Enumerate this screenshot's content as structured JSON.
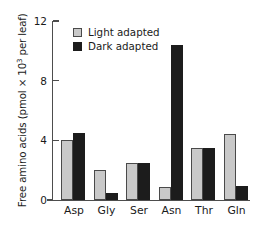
{
  "chart_data": {
    "type": "bar",
    "title": "",
    "xlabel": "",
    "ylabel": "Free amino acids (pmol × 10³ per leaf)",
    "ylabel_prefix": "Free amino acids (pmol × 10",
    "ylabel_exponent": "3",
    "ylabel_suffix": " per leaf)",
    "categories": [
      "Asp",
      "Gly",
      "Ser",
      "Asn",
      "Thr",
      "Gln"
    ],
    "series": [
      {
        "name": "Light adapted",
        "color": "#c9c9c9",
        "values": [
          4.0,
          2.0,
          2.5,
          0.85,
          3.5,
          4.4
        ]
      },
      {
        "name": "Dark adapted",
        "color": "#1c1c1c",
        "values": [
          4.5,
          0.45,
          2.45,
          10.4,
          3.5,
          0.95
        ]
      }
    ],
    "ylim": [
      0,
      12
    ],
    "yticks": [
      0,
      4,
      8,
      12
    ],
    "ytick_labels": [
      "0",
      "4",
      "8",
      "12"
    ],
    "grid": false,
    "legend_position": "top-left-inside"
  },
  "legend": {
    "items": [
      {
        "label": "Light adapted",
        "swatch": "light"
      },
      {
        "label": "Dark adapted",
        "swatch": "dark"
      }
    ]
  }
}
